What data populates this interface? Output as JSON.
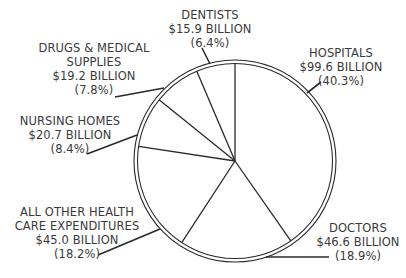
{
  "chart_data": {
    "type": "pie",
    "title": "",
    "unit": "billion USD",
    "start_angle_deg": 0,
    "direction": "clockwise",
    "slices": [
      {
        "name": "HOSPITALS",
        "value": 99.6,
        "value_label": "$99.6 BILLION",
        "percent": 40.3,
        "percent_label": "(40.3%)"
      },
      {
        "name": "DOCTORS",
        "value": 46.6,
        "value_label": "$46.6 BILLION",
        "percent": 18.9,
        "percent_label": "(18.9%)"
      },
      {
        "name": "ALL OTHER HEALTH CARE EXPENDITURES",
        "value": 45.0,
        "value_label": "$45.0 BILLION",
        "percent": 18.2,
        "percent_label": "(18.2%)"
      },
      {
        "name": "NURSING HOMES",
        "value": 20.7,
        "value_label": "$20.7 BILLION",
        "percent": 8.4,
        "percent_label": "(8.4%)"
      },
      {
        "name": "DRUGS & MEDICAL SUPPLIES",
        "value": 19.2,
        "value_label": "$19.2 BILLION",
        "percent": 7.8,
        "percent_label": "(7.8%)"
      },
      {
        "name": "DENTISTS",
        "value": 15.9,
        "value_label": "$15.9 BILLION",
        "percent": 6.4,
        "percent_label": "(6.4%)"
      }
    ],
    "legend": "none (direct callout labels)"
  },
  "labels": {
    "hospitals": {
      "line1": "HOSPITALS",
      "line2": "$99.6 BILLION",
      "line3": "(40.3%)"
    },
    "doctors": {
      "line1": "DOCTORS",
      "line2": "$46.6 BILLION",
      "line3": "(18.9%)"
    },
    "all_other": {
      "line1": "ALL OTHER HEALTH",
      "line2": "CARE EXPENDITURES",
      "line3": "$45.0 BILLION",
      "line4": "(18.2%)"
    },
    "nursing": {
      "line1": "NURSING HOMES",
      "line2": "$20.7 BILLION",
      "line3": "(8.4%)"
    },
    "drugs": {
      "line1": "DRUGS & MEDICAL",
      "line2": "SUPPLIES",
      "line3": "$19.2 BILLION",
      "line4": "(7.8%)"
    },
    "dentists": {
      "line1": "DENTISTS",
      "line2": "$15.9 BILLION",
      "line3": "(6.4%)"
    }
  },
  "colors": {
    "stroke": "#2a2a2a",
    "fill": "#ffffff",
    "text": "#3a3a3a"
  }
}
